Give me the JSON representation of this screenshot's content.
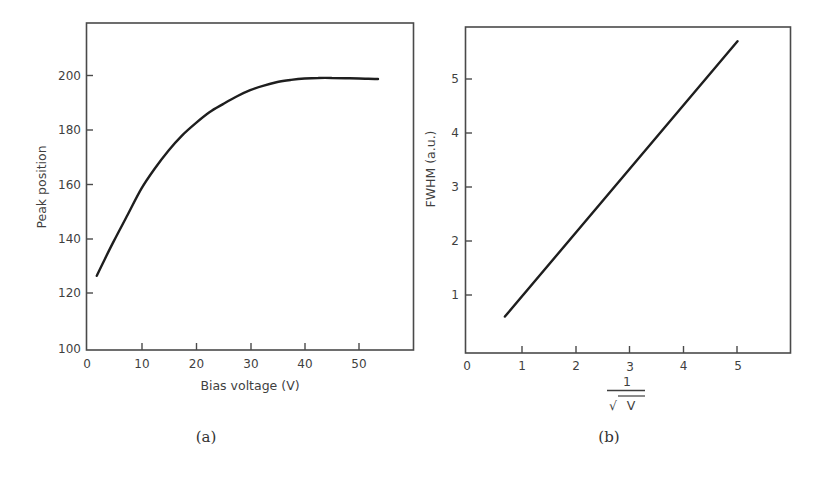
{
  "chart_data": [
    {
      "id": "a",
      "type": "line",
      "caption": "(a)",
      "title": "",
      "xlabel": "Bias voltage (V)",
      "ylabel": "Peak position",
      "xlim": [
        0,
        60
      ],
      "ylim": [
        100,
        220
      ],
      "xticks": [
        0,
        10,
        20,
        30,
        40,
        50
      ],
      "yticks": [
        100,
        120,
        140,
        160,
        180,
        200
      ],
      "grid": false,
      "legend": null,
      "series": [
        {
          "name": "Peak position",
          "x": [
            1.8,
            3,
            5,
            7.5,
            10,
            12.5,
            15,
            17.5,
            20,
            22.5,
            25,
            27.5,
            30,
            32.5,
            35,
            37.5,
            40,
            42.5,
            45,
            47.5,
            50,
            53.5
          ],
          "y": [
            126.5,
            131.5,
            139.5,
            149,
            158.5,
            166,
            172.5,
            178,
            182.5,
            186.5,
            189.5,
            192.3,
            194.6,
            196.3,
            197.6,
            198.4,
            198.9,
            199.1,
            199.1,
            199.0,
            198.9,
            198.7
          ]
        }
      ]
    },
    {
      "id": "b",
      "type": "line",
      "caption": "(b)",
      "title": "",
      "xlabel": "1/√V",
      "xlabel_numerator": "1",
      "xlabel_denominator": "V",
      "ylabel": "FWHM (a.u.)",
      "xlim": [
        0,
        6
      ],
      "ylim": [
        0,
        6
      ],
      "xticks": [
        0,
        1,
        2,
        3,
        4,
        5
      ],
      "yticks": [
        1,
        2,
        3,
        4,
        5
      ],
      "grid": false,
      "legend": null,
      "series": [
        {
          "name": "FWHM",
          "x": [
            0.7,
            5.0
          ],
          "y": [
            0.6,
            5.7
          ]
        }
      ]
    }
  ],
  "labels": {
    "a": {
      "xlabel": "Bias voltage (V)",
      "ylabel": "Peak position",
      "caption": "(a)",
      "xticks": [
        "0",
        "10",
        "20",
        "30",
        "40",
        "50"
      ],
      "yticks": [
        "100",
        "120",
        "140",
        "160",
        "180",
        "200"
      ]
    },
    "b": {
      "ylabel": "FWHM (a.u.)",
      "frac_num": "1",
      "frac_den": "V",
      "radical": "√",
      "caption": "(b)",
      "xticks": [
        "0",
        "1",
        "2",
        "3",
        "4",
        "5"
      ],
      "yticks": [
        "1",
        "2",
        "3",
        "4",
        "5"
      ]
    }
  }
}
